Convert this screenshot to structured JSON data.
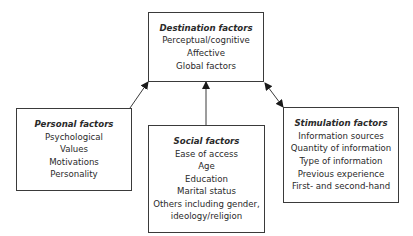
{
  "diagram": {
    "destination": {
      "title": "Destination factors",
      "items": [
        "Perceptual/cognitive",
        "Affective",
        "Global factors"
      ]
    },
    "personal": {
      "title": "Personal factors",
      "items": [
        "Psychological",
        "Values",
        "Motivations",
        "Personality"
      ]
    },
    "social": {
      "title": "Social factors",
      "items": [
        "Ease of access",
        "Age",
        "Education",
        "Marital status",
        "Others including gender,",
        "ideology/religion"
      ]
    },
    "stimulation": {
      "title": "Stimulation factors",
      "items": [
        "Information sources",
        "Quantity of information",
        "Type of information",
        "Previous experience",
        "First- and second-hand"
      ]
    },
    "connections": [
      {
        "from": "personal",
        "to": "destination",
        "type": "one-way"
      },
      {
        "from": "social",
        "to": "destination",
        "type": "one-way"
      },
      {
        "from": "stimulation",
        "to": "destination",
        "type": "two-way"
      }
    ],
    "colors": {
      "line": "#3a3a3a",
      "text": "#2a2a2a",
      "background": "#ffffff"
    }
  }
}
